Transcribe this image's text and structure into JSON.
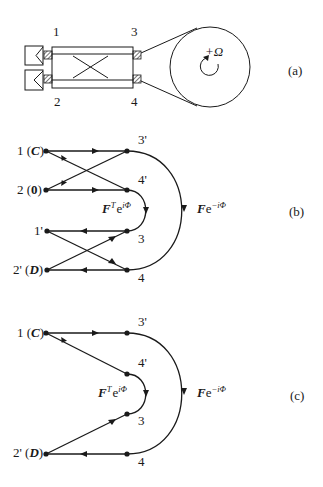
{
  "figure": {
    "panels": [
      {
        "id": "a",
        "tag": "(a)",
        "description": "Fiber-optic Sagnac interferometer: two detectors, a 2x2 coupler with ports 1,2,3,4 and a fiber coil rotating at +Omega",
        "ports": {
          "p1": "1",
          "p2": "2",
          "p3": "3",
          "p4": "4"
        },
        "rotation_label": "+Ω"
      },
      {
        "id": "b",
        "tag": "(b)",
        "nodes": {
          "n1": "1 (C)",
          "n1_num": "1 (",
          "n1_sym": "C",
          "n2_num": "2 (",
          "n2_sym": "0",
          "close": ")",
          "n1p": "1'",
          "n2p_num": "2' (",
          "n2p_sym": "D",
          "n3p": "3'",
          "n4p": "4'",
          "n3": "3",
          "n4": "4"
        },
        "inner_transfer": {
          "F": "F",
          "T": "T",
          "e": "e",
          "exp": "iΦ"
        },
        "outer_transfer": {
          "F": "F",
          "e": "e",
          "exp": "−iΦ"
        }
      },
      {
        "id": "c",
        "tag": "(c)",
        "nodes": {
          "n1_num": "1 (",
          "n1_sym": "C",
          "close": ")",
          "n2p_num": "2' (",
          "n2p_sym": "D",
          "n3p": "3'",
          "n4p": "4'",
          "n3": "3",
          "n4": "4"
        },
        "inner_transfer": {
          "F": "F",
          "T": "T",
          "e": "e",
          "exp": "iΦ"
        },
        "outer_transfer": {
          "F": "F",
          "e": "e",
          "exp": "−iΦ"
        }
      }
    ],
    "colors": {
      "ink": "#1a1a1a",
      "background": "#ffffff"
    }
  }
}
